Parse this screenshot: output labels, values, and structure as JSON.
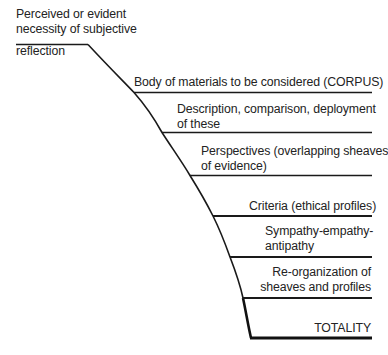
{
  "diagram": {
    "stroke_color": "#1a1a1a",
    "text_color": "#232323",
    "top_label": {
      "lines": [
        "Perceived or evident",
        "necessity of subjective",
        "reflection"
      ]
    },
    "steps": [
      {
        "id": "corpus",
        "lines": [
          "Body of materials to be considered (CORPUS)"
        ]
      },
      {
        "id": "description",
        "lines": [
          "Description, comparison, deployment",
          "of these"
        ]
      },
      {
        "id": "perspectives",
        "lines": [
          "Perspectives (overlapping sheaves",
          "of evidence)"
        ]
      },
      {
        "id": "criteria",
        "lines": [
          "Criteria (ethical profiles)"
        ]
      },
      {
        "id": "sympathy",
        "lines": [
          "Sympathy-empathy-",
          "antipathy"
        ]
      },
      {
        "id": "reorganization",
        "lines": [
          "Re-organization of",
          "sheaves and profiles"
        ]
      },
      {
        "id": "totality",
        "lines": [
          "TOTALITY"
        ]
      }
    ]
  }
}
